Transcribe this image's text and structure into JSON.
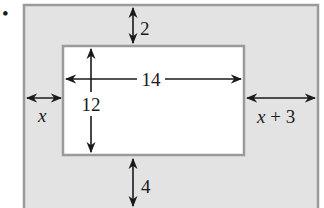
{
  "bullet": "•",
  "diagram": {
    "type": "framed-rectangle",
    "colors": {
      "border_fill": "#e3e3e3",
      "border_stroke": "#9a9a9a",
      "inner_fill": "#ffffff",
      "arrow": "#1a1a1a"
    },
    "inner_rectangle": {
      "width_label": "14",
      "height_label": "12"
    },
    "margins": {
      "top_label": "2",
      "bottom_label": "4",
      "left_label": "x",
      "right_label_var": "x",
      "right_label_rest": " + 3"
    }
  }
}
